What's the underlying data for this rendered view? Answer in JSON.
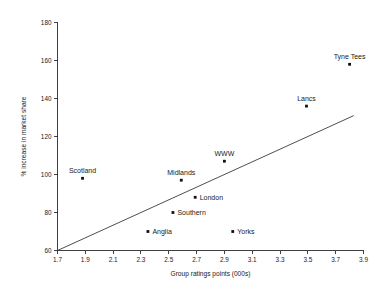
{
  "chart_data": {
    "type": "scatter",
    "title": "",
    "xlabel": "Group ratings points (000s)",
    "ylabel": "% increase in market share",
    "xlim": [
      1.7,
      3.9
    ],
    "ylim": [
      60,
      180
    ],
    "xticks": [
      "1.7",
      "1.9",
      "2.1",
      "2.3",
      "2.5",
      "2.7",
      "2.9",
      "3.1",
      "3.3",
      "3.5",
      "3.7",
      "3.9"
    ],
    "yticks": [
      "60",
      "80",
      "100",
      "120",
      "140",
      "160",
      "180"
    ],
    "grid": false,
    "legend": "none",
    "points": [
      {
        "label": "Scotland",
        "x": 1.88,
        "y": 98,
        "label_pos": "above"
      },
      {
        "label": "Anglia",
        "x": 2.35,
        "y": 70,
        "label_pos": "right"
      },
      {
        "label": "Southern",
        "x": 2.53,
        "y": 80,
        "label_pos": "right"
      },
      {
        "label": "Midlands",
        "x": 2.59,
        "y": 97,
        "label_pos": "above"
      },
      {
        "label": "London",
        "x": 2.69,
        "y": 88,
        "label_pos": "right"
      },
      {
        "label": "WWW",
        "x": 2.9,
        "y": 107,
        "label_pos": "above"
      },
      {
        "label": "Yorks",
        "x": 2.96,
        "y": 70,
        "label_pos": "right"
      },
      {
        "label": "Lancs",
        "x": 3.49,
        "y": 136,
        "label_pos": "above"
      },
      {
        "label": "Tyne Tees",
        "x": 3.8,
        "y": 158,
        "label_pos": "above"
      }
    ],
    "trend_line": {
      "x0": 1.7,
      "y0": 60,
      "x1": 3.83,
      "y1": 131
    },
    "colors": {
      "marker": "#111111",
      "axis": "#2b2b2b",
      "trend": "#3a3a3a",
      "text": "#1a1a1a",
      "background": "#ffffff"
    }
  }
}
